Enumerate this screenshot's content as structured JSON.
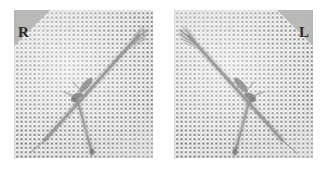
{
  "figure": {
    "background_color": "#ffffff",
    "panel_count": 2,
    "mesh": {
      "description": "regular woven dot grid fabric",
      "dot_color": "#46484a",
      "cloth_color": "#fdfdfc",
      "dot_pitch_px": 4.35
    }
  },
  "panels": [
    {
      "id": "panel-right-specimen",
      "laterality_code": "R",
      "laterality_name": "right",
      "marker_corner": "top-left",
      "marker_fill": "#b9b9b7",
      "marker_text_color": "#2b2b2b",
      "mirrored": false,
      "specimen": {
        "name": "suture-needle-assembly",
        "strand_color": "#8e9092",
        "frayed_end_corner": "top-right",
        "branch_end_corner": "bottom-center"
      }
    },
    {
      "id": "panel-left-specimen",
      "laterality_code": "L",
      "laterality_name": "left",
      "marker_corner": "top-right",
      "marker_fill": "#b9b9b7",
      "marker_text_color": "#2b2b2b",
      "mirrored": true,
      "specimen": {
        "name": "suture-needle-assembly",
        "strand_color": "#8e9092",
        "frayed_end_corner": "top-left",
        "branch_end_corner": "bottom-center"
      }
    }
  ]
}
